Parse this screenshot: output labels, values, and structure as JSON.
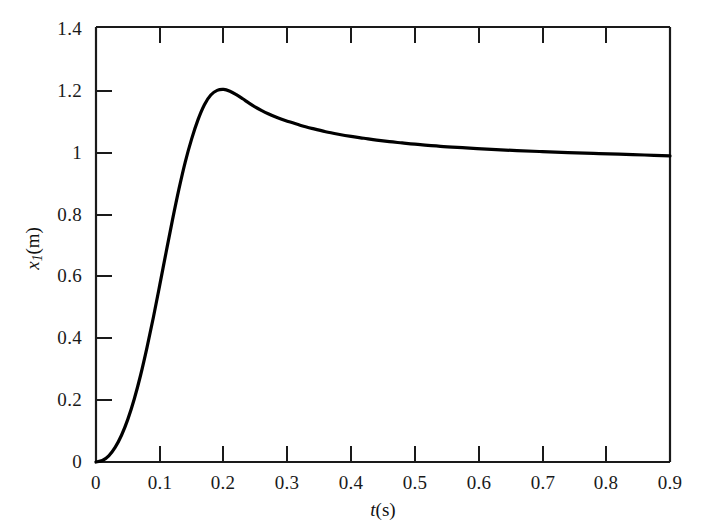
{
  "figure": {
    "background_color": "#ffffff",
    "axis_color": "#1a1a1a",
    "curve_color": "#000000",
    "curve_width_px": 3.2
  },
  "axes": {
    "x_title_var": "t",
    "x_title_unit": "(s)",
    "y_title_var": "x",
    "y_title_sub": "1",
    "y_title_unit": "(m)",
    "x_ticks": [
      "0",
      "0.1",
      "0.2",
      "0.3",
      "0.4",
      "0.5",
      "0.6",
      "0.7",
      "0.8",
      "0.9"
    ],
    "y_ticks": [
      "0",
      "0.2",
      "0.4",
      "0.6",
      "0.8",
      "1",
      "1.2",
      "1.4"
    ]
  },
  "chart_data": {
    "type": "line",
    "title": "",
    "subtitle": "",
    "xlabel": "t(s)",
    "ylabel": "x1(m)",
    "xlim": [
      0,
      0.9
    ],
    "ylim": [
      0,
      1.4
    ],
    "xticks": [
      0,
      0.1,
      0.2,
      0.3,
      0.4,
      0.5,
      0.6,
      0.7,
      0.8,
      0.9
    ],
    "yticks": [
      0,
      0.2,
      0.4,
      0.6,
      0.8,
      1.0,
      1.2,
      1.4
    ],
    "grid": false,
    "legend": null,
    "annotations": [],
    "series": [
      {
        "name": "x1",
        "color": "#000000",
        "x": [
          0,
          0.01,
          0.02,
          0.03,
          0.04,
          0.05,
          0.06,
          0.07,
          0.08,
          0.09,
          0.1,
          0.11,
          0.12,
          0.13,
          0.14,
          0.15,
          0.16,
          0.17,
          0.18,
          0.19,
          0.2,
          0.21,
          0.22,
          0.23,
          0.24,
          0.25,
          0.26,
          0.27,
          0.28,
          0.29,
          0.3,
          0.32,
          0.34,
          0.36,
          0.38,
          0.4,
          0.42,
          0.44,
          0.46,
          0.48,
          0.5,
          0.54,
          0.58,
          0.62,
          0.66,
          0.7,
          0.74,
          0.78,
          0.82,
          0.86,
          0.9
        ],
        "y": [
          0.0,
          0.005,
          0.02,
          0.047,
          0.086,
          0.138,
          0.203,
          0.28,
          0.369,
          0.466,
          0.57,
          0.676,
          0.78,
          0.878,
          0.966,
          1.04,
          1.102,
          1.15,
          1.181,
          1.196,
          1.199,
          1.193,
          1.182,
          1.169,
          1.155,
          1.142,
          1.131,
          1.121,
          1.112,
          1.104,
          1.097,
          1.084,
          1.073,
          1.063,
          1.055,
          1.048,
          1.042,
          1.036,
          1.031,
          1.027,
          1.023,
          1.016,
          1.011,
          1.006,
          1.002,
          0.999,
          0.996,
          0.993,
          0.991,
          0.988,
          0.985
        ]
      }
    ],
    "key_features": {
      "peak_value": 1.2,
      "peak_time": 0.19,
      "steady_state": 1.0,
      "initial_value": 0.0,
      "final_value_plotted": 0.985
    }
  }
}
